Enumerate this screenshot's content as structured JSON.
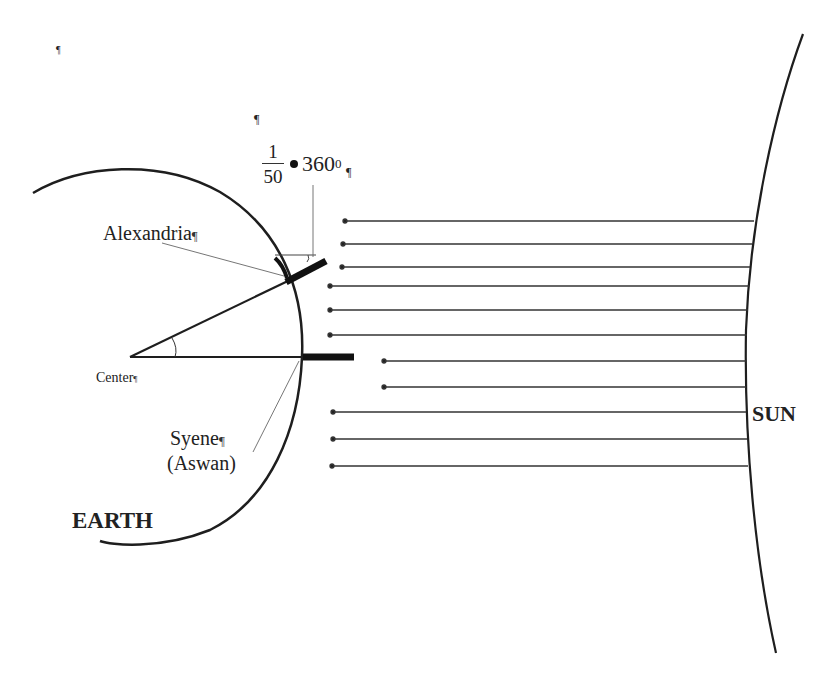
{
  "diagram": {
    "labels": {
      "alexandria": "Alexandria",
      "center": "Center",
      "syene": "Syene",
      "aswan": "(Aswan)",
      "earth": "EARTH",
      "sun": "SUN"
    },
    "formula": {
      "numerator": "1",
      "denominator": "50",
      "operator": "•",
      "value": "360",
      "superscript": "0"
    },
    "formatting_marks": {
      "pilcrow": "¶",
      "small_mark": "¶"
    },
    "colors": {
      "line": "#1e1e1e",
      "thin_line": "#555555",
      "background": "#ffffff"
    },
    "sun_rays_count": 14
  }
}
